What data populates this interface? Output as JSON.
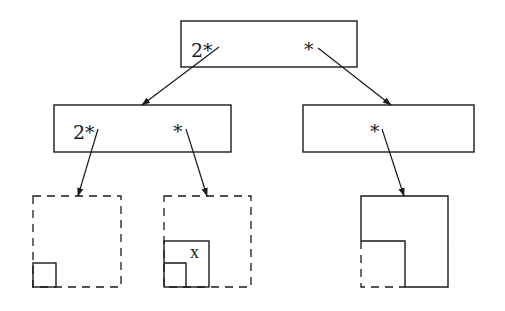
{
  "diagram": {
    "title": "",
    "colors": {
      "stroke": "#1a1a1a",
      "background": "#ffffff"
    },
    "nodes": {
      "root": {
        "labels": [
          "2*",
          "*"
        ]
      },
      "left": {
        "labels": [
          "2*",
          "*"
        ]
      },
      "right": {
        "labels": [
          "*"
        ]
      }
    },
    "leaves": {
      "leaf1": {
        "label": ""
      },
      "leaf2": {
        "label": "x"
      },
      "leaf3": {
        "label": ""
      }
    },
    "edges": [
      {
        "from": "root.2*",
        "to": "left"
      },
      {
        "from": "root.*",
        "to": "right"
      },
      {
        "from": "left.2*",
        "to": "leaf1"
      },
      {
        "from": "left.*",
        "to": "leaf2"
      },
      {
        "from": "right.*",
        "to": "leaf3"
      }
    ]
  }
}
